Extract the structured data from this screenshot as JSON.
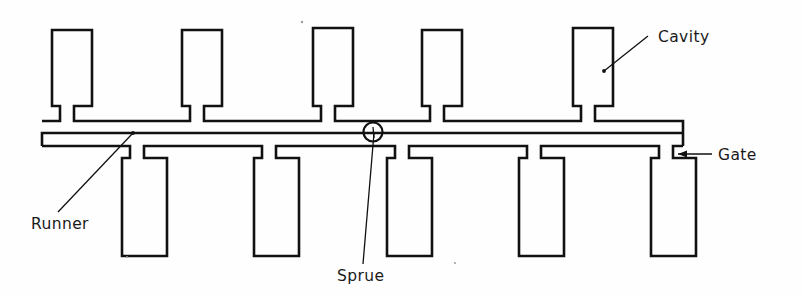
{
  "diagram": {
    "title": "Injection mould multi-cavity layout with runner, sprue and gates",
    "type": "technical-line-drawing",
    "background_color": "#fefefe",
    "line_color": "#111111",
    "canvas": {
      "width": 802,
      "height": 296
    },
    "labels": [
      {
        "id": "cavity",
        "text": "Cavity",
        "text_x": 658,
        "text_y": 42,
        "leader": {
          "x1": 648,
          "y1": 36,
          "x2": 604,
          "y2": 71
        },
        "dot": {
          "x": 604,
          "y": 71
        }
      },
      {
        "id": "gate",
        "text": "Gate",
        "text_x": 718,
        "text_y": 160,
        "leader": {
          "x1": 712,
          "y1": 154,
          "x2": 678,
          "y2": 154
        },
        "arrow": {
          "x": 678,
          "y": 154,
          "dir": "left"
        }
      },
      {
        "id": "runner",
        "text": "Runner",
        "text_x": 31,
        "text_y": 229,
        "leader": {
          "x1": 58,
          "y1": 212,
          "x2": 133,
          "y2": 133
        },
        "dot": {
          "x": 133,
          "y": 133
        }
      },
      {
        "id": "sprue",
        "text": "Sprue",
        "text_x": 337,
        "text_y": 281,
        "leader": {
          "x1": 363,
          "y1": 264,
          "x2": 374,
          "y2": 133
        }
      }
    ],
    "sprue_marker": {
      "cx": 373,
      "cy": 132,
      "r": 9.5
    },
    "runner": {
      "upper_y_top": 121,
      "upper_y_bottom": 133,
      "lower_y_top": 146,
      "lower_y_bottom": 158,
      "left_x": 42,
      "right_x": 683
    },
    "top_cavities": [
      {
        "index": 1,
        "x": 52,
        "y": 30,
        "width": 40,
        "height": 76,
        "neck_x": 60,
        "neck_width": 14
      },
      {
        "index": 2,
        "x": 182,
        "y": 30,
        "width": 40,
        "height": 76,
        "neck_x": 190,
        "neck_width": 14
      },
      {
        "index": 3,
        "x": 313,
        "y": 28,
        "width": 40,
        "height": 78,
        "neck_x": 321,
        "neck_width": 14
      },
      {
        "index": 4,
        "x": 422,
        "y": 30,
        "width": 40,
        "height": 76,
        "neck_x": 430,
        "neck_width": 14
      },
      {
        "index": 5,
        "x": 573,
        "y": 28,
        "width": 40,
        "height": 78,
        "neck_x": 581,
        "neck_width": 14
      }
    ],
    "bottom_cavities": [
      {
        "index": 1,
        "x": 122,
        "y": 170,
        "width": 45,
        "height": 86,
        "neck_x": 130,
        "neck_width": 14
      },
      {
        "index": 2,
        "x": 254,
        "y": 170,
        "width": 45,
        "height": 86,
        "neck_x": 262,
        "neck_width": 14
      },
      {
        "index": 3,
        "x": 387,
        "y": 170,
        "width": 45,
        "height": 86,
        "neck_x": 395,
        "neck_width": 14
      },
      {
        "index": 4,
        "x": 519,
        "y": 170,
        "width": 45,
        "height": 86,
        "neck_x": 527,
        "neck_width": 14
      },
      {
        "index": 5,
        "x": 651,
        "y": 170,
        "width": 45,
        "height": 86,
        "neck_x": 659,
        "neck_width": 14
      }
    ],
    "specks": [
      {
        "x": 302,
        "y": 22,
        "r": 1.2
      },
      {
        "x": 127,
        "y": 257,
        "r": 1.0
      },
      {
        "x": 455,
        "y": 263,
        "r": 1.0
      }
    ]
  }
}
